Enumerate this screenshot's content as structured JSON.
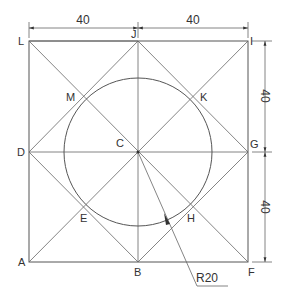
{
  "diagram": {
    "type": "geometric-construction",
    "points": {
      "L": "L",
      "J": "J",
      "I": "I",
      "M": "M",
      "K": "K",
      "D": "D",
      "C": "C",
      "G": "G",
      "E": "E",
      "H": "H",
      "A": "A",
      "B": "B",
      "F": "F"
    },
    "dimensions": {
      "top_left": "40",
      "top_right": "40",
      "right_upper": "40",
      "right_lower": "40",
      "radius": "R20"
    },
    "colors": {
      "line": "#555555",
      "text": "#333333",
      "background": "#ffffff"
    }
  }
}
